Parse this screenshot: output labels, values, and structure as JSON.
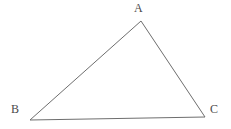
{
  "figure": {
    "name": "triangle-abc",
    "type": "geometry-diagram",
    "background_color": "#ffffff",
    "stroke_color": "#6e6e6e",
    "label_color": "#4a4a4a",
    "stroke_width": 1,
    "canvas": {
      "width": 231,
      "height": 129
    },
    "vertices": [
      {
        "id": "A",
        "label": "A",
        "x": 141,
        "y": 21,
        "label_x": 134,
        "label_y": 2
      },
      {
        "id": "B",
        "label": "B",
        "x": 30,
        "y": 120,
        "label_x": 11,
        "label_y": 103
      },
      {
        "id": "C",
        "label": "C",
        "x": 205,
        "y": 117,
        "label_x": 210,
        "label_y": 103
      }
    ],
    "edges": [
      {
        "id": "AB",
        "from": "A",
        "to": "B"
      },
      {
        "id": "AC",
        "from": "A",
        "to": "C"
      },
      {
        "id": "BC",
        "from": "B",
        "to": "C"
      }
    ],
    "polygon_points": "141,21 30,120 205,117"
  }
}
